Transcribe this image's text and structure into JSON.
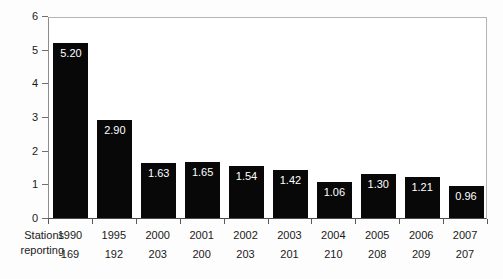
{
  "chart_data": {
    "type": "bar",
    "title": "",
    "xlabel": "",
    "ylabel": "Accidents per 1 000 000 person-hours worked",
    "categories": [
      "1990",
      "1995",
      "2000",
      "2001",
      "2002",
      "2003",
      "2004",
      "2005",
      "2006",
      "2007"
    ],
    "values": [
      5.2,
      2.9,
      1.63,
      1.65,
      1.54,
      1.42,
      1.06,
      1.3,
      1.21,
      0.96
    ],
    "value_labels": [
      "5.20",
      "2.90",
      "1.63",
      "1.65",
      "1.54",
      "1.42",
      "1.06",
      "1.30",
      "1.21",
      "0.96"
    ],
    "ylim": [
      0,
      6
    ],
    "yticks": [
      0,
      1,
      2,
      3,
      4,
      5,
      6
    ],
    "ytick_labels": [
      "0",
      "1",
      "2",
      "3",
      "4",
      "5",
      "6"
    ],
    "grid": false,
    "legend": null,
    "bar_color": "#080808",
    "label_color": "#ffffff",
    "secondary_row": {
      "label_line1": "Stations",
      "label_line2": "reporting",
      "values": [
        "169",
        "192",
        "203",
        "200",
        "203",
        "201",
        "210",
        "208",
        "209",
        "207"
      ]
    }
  }
}
